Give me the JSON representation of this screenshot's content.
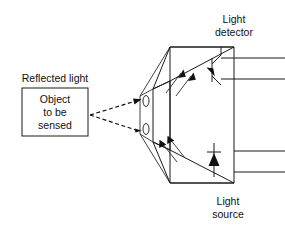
{
  "figure": {
    "background_color": "#ffffff",
    "line_color": "#1a1a1a",
    "text_color": "#111111",
    "width": 285,
    "height": 227
  },
  "labels": {
    "light_detector_line1": "Light",
    "light_detector_line2": "detector",
    "light_source_line1": "Light",
    "light_source_line2": "source",
    "reflected_light": "Reflected light",
    "object_line1": "Object",
    "object_line2": "to be",
    "object_line3": "sensed"
  },
  "components": {
    "object_box": {
      "name": "Object to be sensed",
      "x": 22,
      "y": 88,
      "width": 66,
      "height": 48
    },
    "sensor_housing": {
      "name": "Sensor housing",
      "shape": "trapezoidal prism"
    },
    "apertures": [
      {
        "name": "upper-aperture",
        "cx": 145,
        "cy": 101
      },
      {
        "name": "lower-aperture",
        "cx": 145,
        "cy": 129
      }
    ],
    "phototransistor": {
      "name": "phototransistor",
      "chamber": "upper"
    },
    "led": {
      "name": "light-emitting-diode",
      "chamber": "lower"
    },
    "leads": [
      {
        "name": "detector-lead-1",
        "y": 58
      },
      {
        "name": "detector-lead-2",
        "y": 79
      },
      {
        "name": "source-lead-1",
        "y": 151
      },
      {
        "name": "source-lead-2",
        "y": 172
      }
    ],
    "rays": {
      "incoming_reflected": "dashed rays from object to apertures",
      "upper_arrows": "two parallel arrows pointing up-right (detected light)",
      "lower_arrows": "two parallel arrows pointing up-left (emitted light)"
    }
  }
}
